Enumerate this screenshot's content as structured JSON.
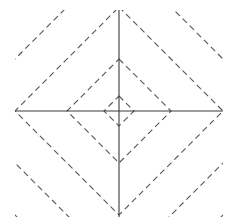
{
  "diagram": {
    "title": "",
    "plot_area": {
      "x": 15,
      "y": 10,
      "width": 208,
      "height": 207
    },
    "center": {
      "x": 119,
      "y": 111
    },
    "axes": {
      "color": "#3a3a3a",
      "width": 1.1,
      "horizontal": {
        "x1": 15,
        "x2": 223,
        "y": 111
      },
      "vertical": {
        "x": 119,
        "y1": 10,
        "y2": 217
      }
    },
    "contours": {
      "shape": "diamond",
      "style": "dashed",
      "color": "#555555",
      "width": 1.1,
      "dash": "6 4",
      "radii": [
        15,
        52,
        104,
        156,
        208
      ]
    }
  }
}
